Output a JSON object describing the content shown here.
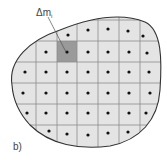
{
  "diagram": {
    "mass_element_label": "Δm",
    "mass_element_subscript": "i",
    "panel_label": "b)",
    "colors": {
      "fill": "#e4e4e4",
      "highlight": "#9a9a9a",
      "outline": "#333333",
      "grid": "#8a8a8a",
      "dot": "#111111"
    },
    "grid": {
      "vertical_lines_x": [
        36,
        57,
        77,
        98,
        119,
        140
      ],
      "horizontal_lines_y": [
        20,
        41,
        62,
        83,
        104,
        125
      ],
      "highlighted_cell": {
        "col": 2,
        "row": 1
      }
    },
    "dots": [
      [
        68,
        35
      ],
      [
        88,
        30
      ],
      [
        108,
        29
      ],
      [
        128,
        31
      ],
      [
        143,
        36
      ],
      [
        46,
        52
      ],
      [
        67,
        52
      ],
      [
        88,
        52
      ],
      [
        108,
        52
      ],
      [
        129,
        52
      ],
      [
        147,
        53
      ],
      [
        25,
        72
      ],
      [
        46,
        72
      ],
      [
        67,
        72
      ],
      [
        88,
        72
      ],
      [
        108,
        72
      ],
      [
        129,
        72
      ],
      [
        149,
        72
      ],
      [
        23,
        93
      ],
      [
        46,
        93
      ],
      [
        67,
        93
      ],
      [
        88,
        93
      ],
      [
        108,
        93
      ],
      [
        129,
        93
      ],
      [
        150,
        93
      ],
      [
        27,
        113
      ],
      [
        46,
        113
      ],
      [
        67,
        113
      ],
      [
        88,
        113
      ],
      [
        108,
        113
      ],
      [
        129,
        113
      ],
      [
        146,
        113
      ],
      [
        49,
        131
      ],
      [
        67,
        134
      ],
      [
        88,
        135
      ],
      [
        108,
        133
      ],
      [
        128,
        132
      ]
    ]
  }
}
